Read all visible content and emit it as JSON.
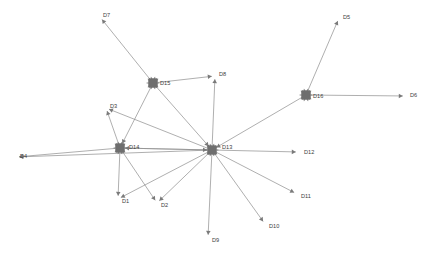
{
  "figure": {
    "title": "",
    "background": "#ffffff",
    "width": 430,
    "height": 255
  },
  "style": {
    "edge_color": "#8c8c8c",
    "node_color": "#6e6e6e",
    "label_color": "#3c3c3c",
    "arrow_color": "#7a7a7a"
  },
  "chart_data": {
    "type": "diagram",
    "diagram_type": "directed-node-link-graph",
    "title": "",
    "xlabel": "",
    "ylabel": "",
    "grid": false,
    "legend": "none",
    "node_count": 16,
    "edge_count": 22,
    "hubs": [
      "D13",
      "D14",
      "D15",
      "D16"
    ],
    "nodes": [
      {
        "id": "D1",
        "label": "D1",
        "x": 118,
        "y": 199,
        "kind": "leaf",
        "label_dx": 4,
        "label_dy": 3
      },
      {
        "id": "D2",
        "label": "D2",
        "x": 157,
        "y": 203,
        "kind": "leaf",
        "label_dx": 4,
        "label_dy": 3
      },
      {
        "id": "D3",
        "label": "D3",
        "x": 106,
        "y": 108,
        "kind": "leaf",
        "label_dx": 4,
        "label_dy": -1
      },
      {
        "id": "D4",
        "label": "D4",
        "x": 16,
        "y": 157,
        "kind": "leaf",
        "label_dx": 4,
        "label_dy": 0
      },
      {
        "id": "D5",
        "label": "D5",
        "x": 339,
        "y": 18,
        "kind": "leaf",
        "label_dx": 4,
        "label_dy": 0
      },
      {
        "id": "D6",
        "label": "D6",
        "x": 406,
        "y": 96,
        "kind": "leaf",
        "label_dx": 4,
        "label_dy": 0
      },
      {
        "id": "D7",
        "label": "D7",
        "x": 100,
        "y": 17,
        "kind": "leaf",
        "label_dx": 3,
        "label_dy": -1
      },
      {
        "id": "D8",
        "label": "D8",
        "x": 215,
        "y": 76,
        "kind": "leaf",
        "label_dx": 4,
        "label_dy": -1
      },
      {
        "id": "D9",
        "label": "D9",
        "x": 208,
        "y": 238,
        "kind": "leaf",
        "label_dx": 4,
        "label_dy": 3
      },
      {
        "id": "D10",
        "label": "D10",
        "x": 265,
        "y": 224,
        "kind": "leaf",
        "label_dx": 4,
        "label_dy": 3
      },
      {
        "id": "D11",
        "label": "D11",
        "x": 297,
        "y": 194,
        "kind": "leaf",
        "label_dx": 4,
        "label_dy": 3
      },
      {
        "id": "D12",
        "label": "D12",
        "x": 299,
        "y": 152,
        "kind": "leaf",
        "label_dx": 5,
        "label_dy": 1
      },
      {
        "id": "D13",
        "label": "D13",
        "x": 212,
        "y": 150,
        "kind": "hub",
        "label_dx": 10,
        "label_dy": -2
      },
      {
        "id": "D14",
        "label": "D14",
        "x": 120,
        "y": 148,
        "kind": "hub",
        "label_dx": 9,
        "label_dy": 0
      },
      {
        "id": "D15",
        "label": "D15",
        "x": 153,
        "y": 83,
        "kind": "hub",
        "label_dx": 7,
        "label_dy": 1
      },
      {
        "id": "D16",
        "label": "D16",
        "x": 306,
        "y": 95,
        "kind": "hub",
        "label_dx": 7,
        "label_dy": 2
      }
    ],
    "edges": [
      {
        "source": "D15",
        "target": "D7",
        "directed": true
      },
      {
        "source": "D15",
        "target": "D8",
        "directed": true
      },
      {
        "source": "D15",
        "target": "D13",
        "directed": true
      },
      {
        "source": "D15",
        "target": "D14",
        "directed": true
      },
      {
        "source": "D16",
        "target": "D5",
        "directed": true
      },
      {
        "source": "D16",
        "target": "D6",
        "directed": true
      },
      {
        "source": "D16",
        "target": "D13",
        "directed": true
      },
      {
        "source": "D14",
        "target": "D1",
        "directed": true
      },
      {
        "source": "D14",
        "target": "D2",
        "directed": true
      },
      {
        "source": "D14",
        "target": "D3",
        "directed": true
      },
      {
        "source": "D14",
        "target": "D4",
        "directed": true
      },
      {
        "source": "D14",
        "target": "D13",
        "directed": true
      },
      {
        "source": "D13",
        "target": "D1",
        "directed": true
      },
      {
        "source": "D13",
        "target": "D2",
        "directed": true
      },
      {
        "source": "D13",
        "target": "D3",
        "directed": true
      },
      {
        "source": "D13",
        "target": "D4",
        "directed": true
      },
      {
        "source": "D13",
        "target": "D8",
        "directed": true
      },
      {
        "source": "D13",
        "target": "D9",
        "directed": true
      },
      {
        "source": "D13",
        "target": "D10",
        "directed": true
      },
      {
        "source": "D13",
        "target": "D11",
        "directed": true
      },
      {
        "source": "D13",
        "target": "D12",
        "directed": true
      },
      {
        "source": "D13",
        "target": "D14",
        "directed": true
      }
    ]
  }
}
